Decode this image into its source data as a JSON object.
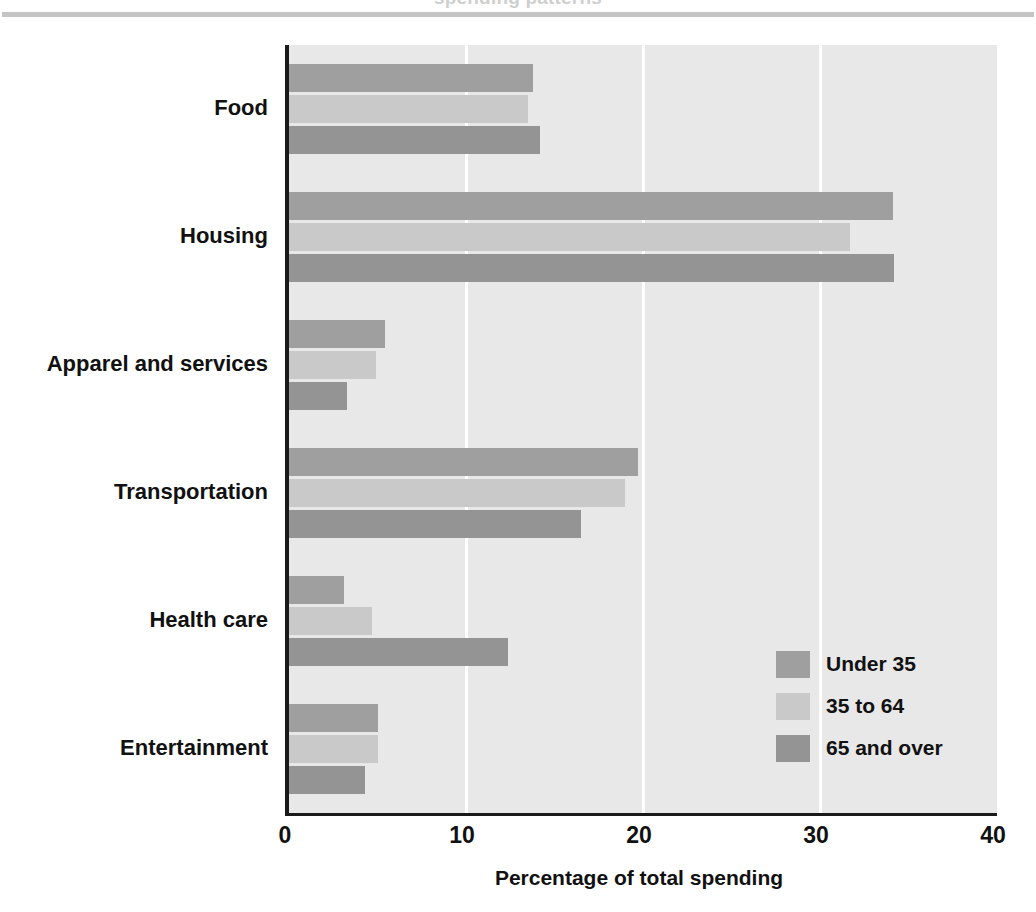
{
  "header": {
    "cut_off_title": "spending patterns",
    "rule_color": "#c4c4c4"
  },
  "axis": {
    "x_label": "Percentage of total spending",
    "x_ticks": [
      "0",
      "10",
      "20",
      "30",
      "40"
    ]
  },
  "legend": {
    "items": [
      {
        "label": "Under 35",
        "color": "#9f9f9f"
      },
      {
        "label": "35 to 64",
        "color": "#c9c9c9"
      },
      {
        "label": "65 and over",
        "color": "#949494"
      }
    ]
  },
  "chart_data": {
    "type": "bar",
    "orientation": "horizontal",
    "title": "",
    "xlabel": "Percentage of total spending",
    "ylabel": "",
    "xlim": [
      0,
      40
    ],
    "xticks": [
      0,
      10,
      20,
      30,
      40
    ],
    "grid": true,
    "legend_position": "inside-bottom-right",
    "categories": [
      "Food",
      "Housing",
      "Apparel and services",
      "Transportation",
      "Health care",
      "Entertainment"
    ],
    "series": [
      {
        "name": "Under 35",
        "color": "#9f9f9f",
        "values": [
          13.8,
          34.1,
          5.4,
          19.7,
          3.1,
          5.0
        ]
      },
      {
        "name": "35 to 64",
        "color": "#c9c9c9",
        "values": [
          13.5,
          31.7,
          4.9,
          19.0,
          4.7,
          5.0
        ]
      },
      {
        "name": "65 and over",
        "color": "#949494",
        "values": [
          14.2,
          34.2,
          3.3,
          16.5,
          12.4,
          4.3
        ]
      }
    ]
  }
}
